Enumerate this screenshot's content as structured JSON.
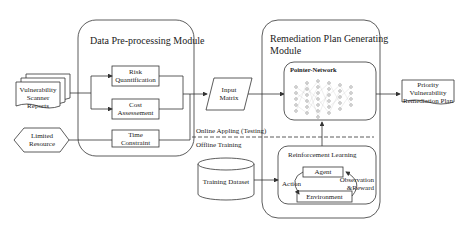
{
  "modules": {
    "preprocessing": {
      "title": "Data Pre-processing Module"
    },
    "remediation": {
      "title_line1": "Remediation Plan Generating",
      "title_line2": "Module"
    }
  },
  "inputs": {
    "scanner_reports": [
      "Vulnerability",
      "Scanner",
      "Reports"
    ],
    "limited_resource": [
      "Limited",
      "Resource"
    ]
  },
  "preprocessing_steps": {
    "risk": [
      "Risk",
      "Quantification"
    ],
    "cost": [
      "Cost",
      "Assessement"
    ],
    "time": [
      "Time",
      "Constraint"
    ]
  },
  "input_matrix": [
    "Input",
    "Matrix"
  ],
  "pointer_network": {
    "title": "Pointer-Network"
  },
  "reinforcement_learning": {
    "title": "Reinforcement Learning",
    "agent": "Agent",
    "environment": "Environment",
    "action": "Action",
    "observation": [
      "Observation",
      "&Reward"
    ]
  },
  "training_dataset": "Training Dataset",
  "phases": {
    "online": "Online  Appling (Testing)",
    "offline": "Offline Training"
  },
  "output": [
    "Priority",
    "Vulnerability",
    "Remediation Plan"
  ],
  "colors": {
    "stroke": "#333333",
    "background": "#ffffff",
    "node": "#888888"
  }
}
